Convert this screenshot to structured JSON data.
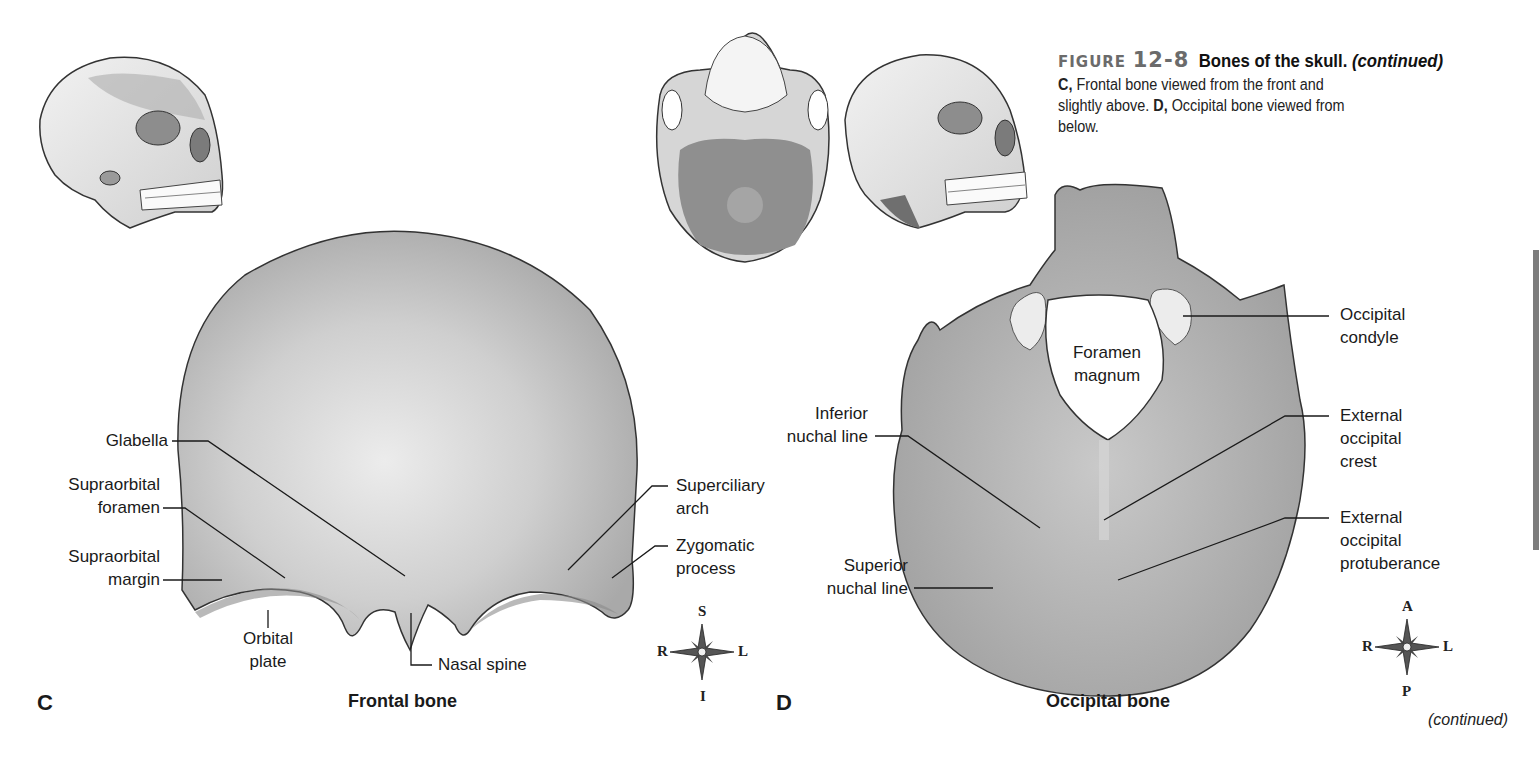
{
  "caption": {
    "figure_word": "FIGURE",
    "figure_number": "12-8",
    "title": "Bones of the skull.",
    "title_suffix": "(continued)",
    "body_c_letter": "C,",
    "body_c_text": "Frontal bone viewed from the front and slightly above.",
    "body_d_letter": "D,",
    "body_d_text": "Occipital bone viewed from below."
  },
  "panel_c": {
    "letter": "C",
    "bone_title": "Frontal bone",
    "labels": {
      "glabella": "Glabella",
      "supraorbital_foramen_1": "Supraorbital",
      "supraorbital_foramen_2": "foramen",
      "supraorbital_margin_1": "Supraorbital",
      "supraorbital_margin_2": "margin",
      "orbital_plate_1": "Orbital",
      "orbital_plate_2": "plate",
      "nasal_spine": "Nasal spine",
      "superciliary_arch_1": "Superciliary",
      "superciliary_arch_2": "arch",
      "zygomatic_process_1": "Zygomatic",
      "zygomatic_process_2": "process"
    },
    "compass": {
      "top": "S",
      "bottom": "I",
      "left": "R",
      "right": "L"
    }
  },
  "panel_d": {
    "letter": "D",
    "bone_title": "Occipital bone",
    "labels": {
      "foramen_magnum_1": "Foramen",
      "foramen_magnum_2": "magnum",
      "occipital_condyle_1": "Occipital",
      "occipital_condyle_2": "condyle",
      "inferior_nuchal_line_1": "Inferior",
      "inferior_nuchal_line_2": "nuchal line",
      "external_occipital_crest_1": "External",
      "external_occipital_crest_2": "occipital",
      "external_occipital_crest_3": "crest",
      "superior_nuchal_line_1": "Superior",
      "superior_nuchal_line_2": "nuchal line",
      "external_occipital_protuberance_1": "External",
      "external_occipital_protuberance_2": "occipital",
      "external_occipital_protuberance_3": "protuberance"
    },
    "compass": {
      "top": "A",
      "bottom": "P",
      "left": "R",
      "right": "L"
    }
  },
  "footer": {
    "continued": "(continued)"
  }
}
